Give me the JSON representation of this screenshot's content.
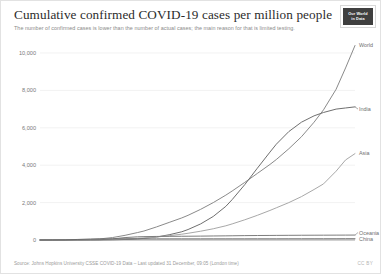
{
  "header": {
    "title": "Cumulative confirmed COVID-19 cases per million people",
    "subtitle": "The number of confirmed cases is lower than the number of actual cases; the main reason for that is limited testing.",
    "logo_line1": "Our World",
    "logo_line2": "in Data"
  },
  "footer": {
    "source": "Source: Johns Hopkins University CSSE COVID-19 Data – Last updated 31 December, 09:05 (London time)",
    "license": "CC BY"
  },
  "chart_data": {
    "type": "line",
    "title": "Cumulative confirmed COVID-19 cases per million people",
    "subtitle": "The number of confirmed cases is lower than the number of actual cases; the main reason for that is limited testing.",
    "xlabel": "",
    "ylabel": "",
    "ylim": [
      0,
      10000
    ],
    "yticks": [
      0,
      2000,
      4000,
      6000,
      8000,
      10000
    ],
    "ytick_labels": [
      "0",
      "2,000",
      "4,000",
      "6,000",
      "8,000",
      "10,000"
    ],
    "xtick_labels": [
      "Jan 4, 2020",
      "Mar 11",
      "Apr 30",
      "Jun 19",
      "Aug 8",
      "Sep 27",
      "Nov 16",
      "Dec 30, 2020"
    ],
    "x_positions_frac": [
      0,
      0.1887,
      0.3302,
      0.4717,
      0.6132,
      0.7547,
      0.8962,
      1.0
    ],
    "grid": true,
    "legend_position": "right-inline",
    "x": [
      0,
      0.04,
      0.08,
      0.12,
      0.16,
      0.19,
      0.23,
      0.27,
      0.31,
      0.33,
      0.37,
      0.41,
      0.45,
      0.47,
      0.51,
      0.55,
      0.59,
      0.61,
      0.65,
      0.69,
      0.73,
      0.75,
      0.79,
      0.83,
      0.87,
      0.9,
      0.94,
      0.97,
      1.0
    ],
    "series": [
      {
        "name": "World",
        "color": "#8a8a8a",
        "label_y": 10450,
        "values": [
          0,
          1,
          3,
          8,
          26,
          60,
          130,
          250,
          400,
          480,
          700,
          940,
          1180,
          1320,
          1640,
          2000,
          2400,
          2620,
          3080,
          3560,
          4040,
          4300,
          4880,
          5520,
          6300,
          6960,
          8060,
          9200,
          10400
        ]
      },
      {
        "name": "India",
        "color": "#6f6f6f",
        "label_y": 7000,
        "values": [
          0,
          0,
          0,
          0,
          1,
          3,
          10,
          28,
          62,
          86,
          160,
          280,
          440,
          560,
          860,
          1260,
          1800,
          2160,
          2960,
          3840,
          4700,
          5120,
          5800,
          6300,
          6640,
          6820,
          7000,
          7060,
          7120
        ]
      },
      {
        "name": "Asia",
        "color": "#a8a8a8",
        "label_y": 4640,
        "values": [
          0,
          1,
          3,
          6,
          12,
          18,
          32,
          56,
          88,
          108,
          160,
          230,
          310,
          360,
          470,
          600,
          760,
          860,
          1080,
          1320,
          1580,
          1720,
          2000,
          2320,
          2700,
          3000,
          3680,
          4280,
          4620
        ]
      },
      {
        "name": "Oceania",
        "color": "#7d7d7d",
        "label_y": 400,
        "values": [
          0,
          0,
          1,
          2,
          6,
          14,
          60,
          130,
          170,
          180,
          190,
          195,
          200,
          202,
          208,
          215,
          222,
          226,
          234,
          240,
          244,
          246,
          250,
          254,
          256,
          258,
          260,
          262,
          264
        ]
      },
      {
        "name": "China",
        "color": "#6a6a6a",
        "label_y": 60,
        "values": [
          0,
          1,
          6,
          30,
          52,
          56,
          58,
          58,
          58,
          58,
          58,
          58,
          59,
          59,
          59,
          60,
          60,
          60,
          60,
          61,
          61,
          61,
          62,
          62,
          63,
          63,
          64,
          65,
          66
        ]
      }
    ]
  }
}
